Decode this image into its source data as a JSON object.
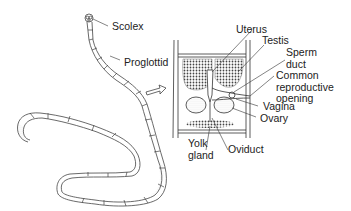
{
  "diagram": {
    "labels": {
      "scolex": "Scolex",
      "proglottid": "Proglottid",
      "uterus": "Uterus",
      "testis": "Testis",
      "sperm_duct": "Sperm\nduct",
      "common_reproductive_opening": "Common\nreproductive\nopening",
      "vagina": "Vagina",
      "ovary": "Ovary",
      "yolk_gland": "Yolk\ngland",
      "oviduct": "Oviduct"
    },
    "colors": {
      "line": "#333333",
      "shade": "#bdbdbd",
      "text": "#222222",
      "background": "#ffffff"
    }
  }
}
